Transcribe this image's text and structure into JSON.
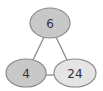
{
  "diagram": {
    "nodes": [
      {
        "id": "top",
        "label": "6",
        "cx": 50,
        "cy": 23,
        "rx": 20,
        "ry": 15,
        "fill": "#c8c8c8"
      },
      {
        "id": "bottom-left",
        "label": "4",
        "cx": 26,
        "cy": 73,
        "rx": 20,
        "ry": 14,
        "fill": "#c8c8c8"
      },
      {
        "id": "bottom-right",
        "label": "24",
        "cx": 75,
        "cy": 73,
        "rx": 21,
        "ry": 14,
        "fill": "#e4e4e4"
      }
    ],
    "edges": [
      {
        "from": "top",
        "to": "bottom-left"
      },
      {
        "from": "top",
        "to": "bottom-right"
      },
      {
        "from": "bottom-left",
        "to": "bottom-right"
      }
    ],
    "colors": {
      "stroke": "#8a8a8a",
      "edge": "#8a8a8a",
      "text": "#333333"
    }
  }
}
